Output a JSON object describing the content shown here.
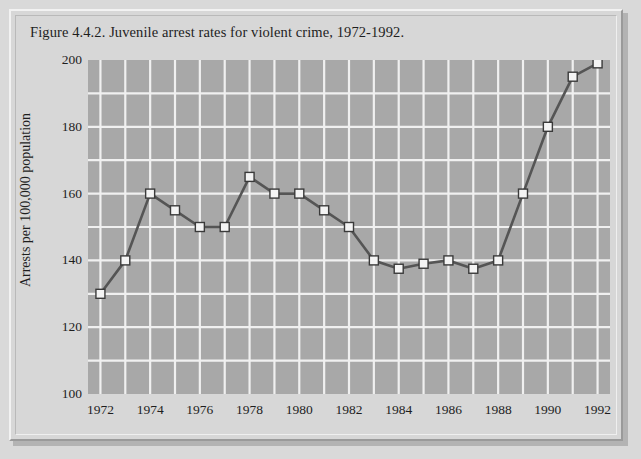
{
  "figure": {
    "title": "Figure 4.4.2. Juvenile arrest rates for violent crime, 1972-1992."
  },
  "chart_data": {
    "type": "line",
    "title": "Figure 4.4.2. Juvenile arrest rates for violent crime, 1972-1992.",
    "xlabel": "",
    "ylabel": "Arrests per 100,000 population",
    "x": [
      1972,
      1973,
      1974,
      1975,
      1976,
      1977,
      1978,
      1979,
      1980,
      1981,
      1982,
      1983,
      1984,
      1985,
      1986,
      1987,
      1988,
      1989,
      1990,
      1991,
      1992
    ],
    "values": [
      130,
      140,
      160,
      155,
      150,
      150,
      165,
      160,
      160,
      155,
      150,
      140,
      137.5,
      139,
      140,
      137.5,
      140,
      160,
      180,
      195,
      199
    ],
    "xlim": [
      1971.5,
      1992.5
    ],
    "ylim": [
      100,
      200
    ],
    "x_tick_labels": [
      "1972",
      "1974",
      "1976",
      "1978",
      "1980",
      "1982",
      "1984",
      "1986",
      "1988",
      "1990",
      "1992"
    ],
    "x_tick_values": [
      1972,
      1974,
      1976,
      1978,
      1980,
      1982,
      1984,
      1986,
      1988,
      1990,
      1992
    ],
    "y_tick_labels": [
      "100",
      "120",
      "140",
      "160",
      "180",
      "200"
    ],
    "y_tick_values": [
      100,
      120,
      140,
      160,
      180,
      200
    ],
    "y_minor_gridlines": [
      110,
      130,
      150,
      170,
      190
    ],
    "grid": true,
    "legend": false,
    "marker": "square",
    "colors": {
      "plot_background": "#a8a8a8",
      "figure_background": "#d7d7d7",
      "page_background": "#d9d9d9",
      "gridline": "#f0f0f0",
      "line": "#555555",
      "marker_fill": "#f4f4f4",
      "marker_edge": "#3a3a3a",
      "text": "#1e1e1e"
    }
  }
}
